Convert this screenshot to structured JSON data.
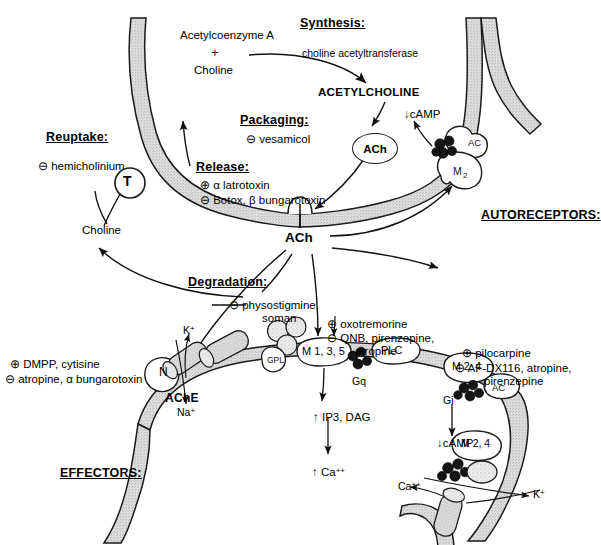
{
  "diagram": {
    "colors": {
      "membrane_fill": "#d9d9d9",
      "outline": "#1a1a1a",
      "g_protein": "#1c1c1c",
      "background": "#ffffff"
    }
  },
  "sections": {
    "synthesis": {
      "heading": "Synthesis:",
      "enzyme": "choline acetyltransferase"
    },
    "packaging": {
      "heading": "Packaging:",
      "items": [
        "⊖ vesamicol"
      ]
    },
    "release": {
      "heading": "Release:",
      "items": [
        "⊕ α latrotoxin",
        "⊖ Botox, β bungarotoxin"
      ]
    },
    "reuptake": {
      "heading": "Reuptake:",
      "items": [
        "⊖ hemicholinium"
      ]
    },
    "degradation": {
      "heading": "Degradation:",
      "items": [
        "⊖ physostigmine,",
        "soman"
      ]
    },
    "autoreceptors": {
      "heading": "AUTORECEPTORS:"
    },
    "effectors": {
      "heading": "EFFECTORS:"
    }
  },
  "molecules": {
    "acetyl_coa": "Acetylcoenzyme A",
    "plus": "+",
    "choline_top": "Choline",
    "acetylcholine": "ACETYLCHOLINE",
    "vesicle_ach": "ACh",
    "cleft_ach": "ACh",
    "choline_recycled": "Choline",
    "ache": "AChE"
  },
  "presyn_receptor": {
    "transporter": "T",
    "ac": "AC",
    "m2": "M2",
    "camp": "cAMP",
    "camp_arrow": "↓"
  },
  "postsyn": {
    "nicotinic": {
      "label": "N",
      "agonists": "⊕ DMPP, cytisine",
      "antagonists": "⊖ atropine, α bungarotoxin",
      "ion_in": "Na",
      "ion_in_charge": "+",
      "ion_out": "K",
      "ion_out_charge": "+"
    },
    "muscarinic_q": {
      "label": "M 1, 3, 5",
      "gprotein": "Gq",
      "effector": "PLC",
      "second_messenger": "IP3, DAG",
      "sm_arrow": "↑",
      "downstream": "Ca",
      "downstream_charge": "++",
      "downstream_arrow": "↑",
      "agonists": "⊕ oxotremorine",
      "antagonists_1": "⊖ QNB, pirenzepine,",
      "antagonists_2": "atropine",
      "gpl": "GPL"
    },
    "muscarinic_i": {
      "label_top": "M 2, 4",
      "label_bottom": "M 2, 4",
      "gprotein": "Gi",
      "effector": "AC",
      "camp": "cAMP",
      "camp_arrow": "↓",
      "agonists": "⊕ pilocarpine",
      "antagonists_1": "⊖ AF-DX116, atropine,",
      "antagonists_2": "pirenzepine",
      "ion_out": "K",
      "ion_out_charge": "+",
      "ion_other": "Ca",
      "ion_other_charge": "++"
    }
  }
}
